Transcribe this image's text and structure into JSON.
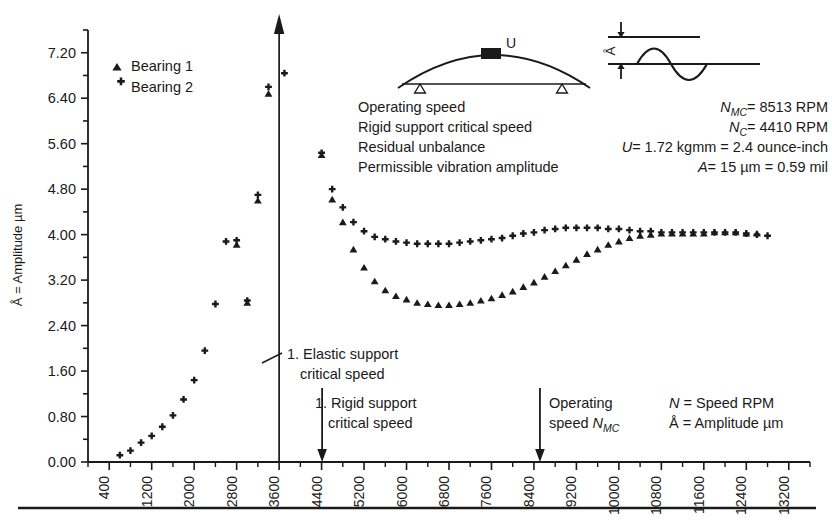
{
  "chart_data": {
    "type": "scatter",
    "title": "",
    "xlabel": "",
    "ylabel": "Å = Amplitude µm",
    "xlim": [
      0,
      13600
    ],
    "ylim": [
      0.0,
      7.6
    ],
    "xticks": [
      400,
      1200,
      2000,
      2800,
      3600,
      4400,
      5200,
      6000,
      6800,
      7600,
      8400,
      9200,
      10000,
      10800,
      11600,
      12400,
      13200
    ],
    "xtick_step": 800,
    "yticks": [
      "0.00",
      "0.80",
      "1.60",
      "2.40",
      "3.20",
      "4.00",
      "4.80",
      "5.60",
      "6.40",
      "7.20"
    ],
    "ytick_step": 0.8,
    "minor_ytick_step": 0.4,
    "grid": false,
    "legend_position": "top-left",
    "series": [
      {
        "name": "Bearing 1",
        "marker": "triangle",
        "points": [
          [
            2800,
            3.82
          ],
          [
            3000,
            2.8
          ],
          [
            3200,
            4.6
          ],
          [
            3400,
            6.48
          ],
          [
            4400,
            5.4
          ],
          [
            4600,
            4.62
          ],
          [
            4800,
            4.22
          ],
          [
            5000,
            3.74
          ],
          [
            5200,
            3.42
          ],
          [
            5400,
            3.18
          ],
          [
            5600,
            3.02
          ],
          [
            5800,
            2.92
          ],
          [
            6000,
            2.86
          ],
          [
            6200,
            2.8
          ],
          [
            6400,
            2.78
          ],
          [
            6600,
            2.76
          ],
          [
            6800,
            2.76
          ],
          [
            7000,
            2.78
          ],
          [
            7200,
            2.8
          ],
          [
            7400,
            2.84
          ],
          [
            7600,
            2.88
          ],
          [
            7800,
            2.94
          ],
          [
            8000,
            3.0
          ],
          [
            8200,
            3.08
          ],
          [
            8400,
            3.16
          ],
          [
            8600,
            3.26
          ],
          [
            8800,
            3.36
          ],
          [
            9000,
            3.46
          ],
          [
            9200,
            3.56
          ],
          [
            9400,
            3.66
          ],
          [
            9600,
            3.74
          ],
          [
            9800,
            3.82
          ],
          [
            10000,
            3.88
          ],
          [
            10200,
            3.94
          ],
          [
            10400,
            3.98
          ],
          [
            10600,
            4.0
          ],
          [
            10800,
            4.02
          ],
          [
            11000,
            4.02
          ],
          [
            11200,
            4.02
          ],
          [
            11400,
            4.02
          ],
          [
            11600,
            4.02
          ],
          [
            11800,
            4.04
          ],
          [
            12000,
            4.04
          ],
          [
            12200,
            4.04
          ],
          [
            12400,
            4.02
          ],
          [
            12600,
            4.02
          ]
        ]
      },
      {
        "name": "Bearing 2",
        "marker": "plus",
        "points": [
          [
            600,
            0.12
          ],
          [
            800,
            0.2
          ],
          [
            1000,
            0.34
          ],
          [
            1200,
            0.46
          ],
          [
            1400,
            0.62
          ],
          [
            1600,
            0.82
          ],
          [
            1800,
            1.1
          ],
          [
            2000,
            1.44
          ],
          [
            2200,
            1.96
          ],
          [
            2400,
            2.78
          ],
          [
            2600,
            3.88
          ],
          [
            2800,
            3.9
          ],
          [
            3000,
            2.84
          ],
          [
            3200,
            4.7
          ],
          [
            3400,
            6.6
          ],
          [
            3700,
            6.84
          ],
          [
            4400,
            5.44
          ],
          [
            4600,
            4.8
          ],
          [
            4800,
            4.48
          ],
          [
            5000,
            4.22
          ],
          [
            5200,
            4.06
          ],
          [
            5400,
            3.96
          ],
          [
            5600,
            3.92
          ],
          [
            5800,
            3.88
          ],
          [
            6000,
            3.86
          ],
          [
            6200,
            3.84
          ],
          [
            6400,
            3.84
          ],
          [
            6600,
            3.84
          ],
          [
            6800,
            3.84
          ],
          [
            7000,
            3.86
          ],
          [
            7200,
            3.88
          ],
          [
            7400,
            3.9
          ],
          [
            7600,
            3.92
          ],
          [
            7800,
            3.94
          ],
          [
            8000,
            3.98
          ],
          [
            8200,
            4.02
          ],
          [
            8400,
            4.04
          ],
          [
            8600,
            4.08
          ],
          [
            8800,
            4.1
          ],
          [
            9000,
            4.12
          ],
          [
            9200,
            4.12
          ],
          [
            9400,
            4.12
          ],
          [
            9600,
            4.12
          ],
          [
            9800,
            4.1
          ],
          [
            10000,
            4.1
          ],
          [
            10200,
            4.08
          ],
          [
            10400,
            4.06
          ],
          [
            10600,
            4.06
          ],
          [
            10800,
            4.04
          ],
          [
            11000,
            4.04
          ],
          [
            11200,
            4.04
          ],
          [
            11400,
            4.04
          ],
          [
            11600,
            4.04
          ],
          [
            11800,
            4.04
          ],
          [
            12000,
            4.04
          ],
          [
            12200,
            4.04
          ],
          [
            12400,
            4.02
          ],
          [
            12600,
            4.0
          ],
          [
            12800,
            3.98
          ]
        ]
      }
    ],
    "annotations": [
      {
        "id": "elastic-critical-speed",
        "text_lines": [
          "1. Elastic support",
          "critical speed"
        ],
        "x": 3600
      },
      {
        "id": "rigid-critical-speed",
        "text_lines": [
          "1. Rigid support",
          "critical speed"
        ],
        "x": 4410
      },
      {
        "id": "operating-speed",
        "text_lines": [
          "Operating",
          "speed N",
          "MC"
        ],
        "x": 8513
      }
    ]
  },
  "legend": {
    "items": [
      {
        "label": "Bearing 1",
        "marker": "triangle-marker"
      },
      {
        "label": "Bearing 2",
        "marker": "plus-marker"
      }
    ]
  },
  "axis": {
    "y_title": "Å = Amplitude µm",
    "y_labels": [
      "7.20",
      "6.40",
      "5.60",
      "4.80",
      "4.00",
      "3.20",
      "2.40",
      "1.60",
      "0.80",
      "0.00"
    ],
    "x_labels": [
      "400",
      "1200",
      "2000",
      "2800",
      "3600",
      "4400",
      "5200",
      "6000",
      "6800",
      "7600",
      "8400",
      "9200",
      "10000",
      "10800",
      "11600",
      "12400",
      "13200"
    ]
  },
  "parameter_list": {
    "lines": [
      "Operating speed",
      "Rigid support critical speed",
      "Residual unbalance",
      "Permissible vibration amplitude"
    ]
  },
  "parameter_values": {
    "nmc": {
      "sym": "N",
      "sub": "MC",
      "value": "= 8513 RPM"
    },
    "nc": {
      "sym": "N",
      "sub": "C",
      "value": "= 4410 RPM"
    },
    "u": {
      "sym": "U",
      "sub": "",
      "value": "= 1.72 kgmm = 2.4 ounce-inch"
    },
    "a": {
      "sym": "A",
      "sub": "",
      "value": "= 15 µm = 0.59 mil"
    }
  },
  "annotations_text": {
    "elastic_line1": "1. Elastic support",
    "elastic_line2": "critical speed",
    "rigid_line1": "1. Rigid support",
    "rigid_line2": "critical speed",
    "operating_line1": "Operating",
    "operating_line2a": "speed ",
    "operating_line2b": "N",
    "operating_line2c": "MC"
  },
  "key_legend": {
    "line1a": "N",
    "line1b": " = Speed RPM",
    "line2a": "Å",
    "line2b": " = Amplitude µm"
  },
  "rotor_diagram": {
    "unbalance_label": "U"
  },
  "wave_diagram": {
    "amplitude_label": "Å"
  },
  "colors": {
    "ink": "#1a1a1a",
    "background": "#ffffff"
  }
}
